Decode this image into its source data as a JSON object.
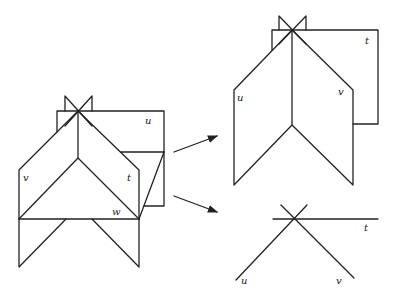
{
  "diagram": {
    "left_figure": {
      "labels": {
        "u": "u",
        "v": "v",
        "t": "t",
        "w": "w"
      }
    },
    "upper_right_figure": {
      "labels": {
        "u": "u",
        "v": "v",
        "t": "t"
      }
    },
    "lower_right_figure": {
      "labels": {
        "u": "u",
        "v": "v",
        "t": "t"
      }
    },
    "arrows": [
      {
        "from": "left_figure",
        "to": "upper_right_figure"
      },
      {
        "from": "left_figure",
        "to": "lower_right_figure"
      }
    ],
    "colors": {
      "stroke": "#222222",
      "background": "#ffffff"
    }
  }
}
